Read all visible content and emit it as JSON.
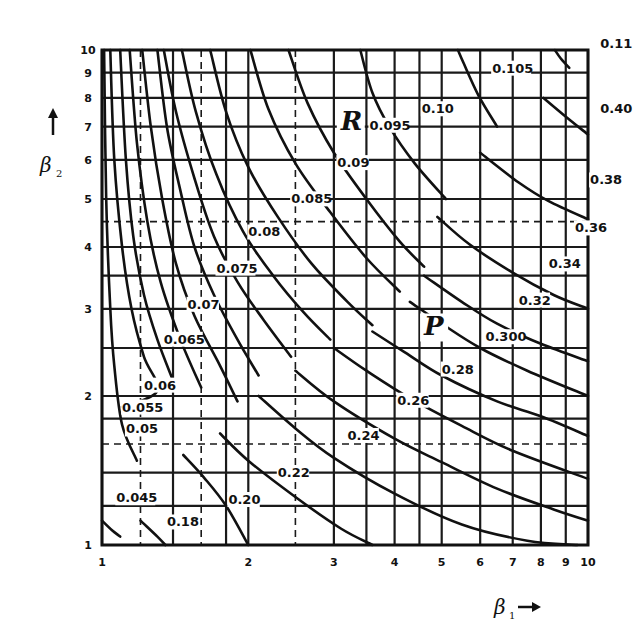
{
  "chart_data": {
    "type": "line",
    "title": "",
    "xlabel": "β1 →",
    "ylabel": "↑ β2",
    "xscale": "log",
    "yscale": "log",
    "xlim": [
      1,
      10
    ],
    "ylim": [
      1,
      10
    ],
    "grid": true,
    "x_ticks": [
      "1",
      "2",
      "3",
      "4",
      "5",
      "6",
      "7",
      "8",
      "9",
      "10"
    ],
    "y_ticks": [
      "1",
      "2",
      "3",
      "4",
      "5",
      "6",
      "7",
      "8",
      "9",
      "10"
    ],
    "x_grid": [
      1,
      1.2,
      1.4,
      1.6,
      1.8,
      2,
      2.5,
      3,
      3.5,
      4,
      4.5,
      5,
      6,
      7,
      8,
      9,
      10
    ],
    "x_grid_dashed": [
      1.2,
      1.6,
      2.5
    ],
    "y_grid": [
      1,
      1.2,
      1.4,
      1.6,
      1.8,
      2,
      2.5,
      3,
      3.5,
      4,
      4.5,
      5,
      6,
      7,
      8,
      9,
      10
    ],
    "y_grid_dashed": [
      1.6,
      4.5
    ],
    "region_labels": [
      {
        "text": "R",
        "x": 3.1,
        "y": 6.9
      },
      {
        "text": "P",
        "x": 4.6,
        "y": 2.65
      }
    ],
    "series": [
      {
        "family": "R",
        "name": "0.045",
        "points": [
          [
            1.01,
            10
          ],
          [
            1.02,
            5
          ],
          [
            1.04,
            3
          ],
          [
            1.06,
            2.3
          ],
          [
            1.1,
            1.75
          ],
          [
            1.18,
            1.48
          ]
        ],
        "p_name": null,
        "p_points": [
          [
            1.0,
            1.12
          ],
          [
            1.05,
            1.07
          ],
          [
            1.09,
            1.04
          ]
        ],
        "label_pos": [
          1.07,
          1.22
        ]
      },
      {
        "family": "R",
        "name": "0.05",
        "points": [
          [
            1.04,
            10
          ],
          [
            1.06,
            6
          ],
          [
            1.1,
            4
          ],
          [
            1.15,
            3
          ],
          [
            1.22,
            2.4
          ],
          [
            1.3,
            2.05
          ],
          [
            1.1,
            1.9
          ]
        ],
        "p_name": null,
        "p_points": [],
        "label_pos": [
          1.12,
          1.68
        ]
      },
      {
        "family": "R",
        "name": "0.055",
        "points": [
          [
            1.09,
            10
          ],
          [
            1.12,
            6
          ],
          [
            1.16,
            4.2
          ],
          [
            1.22,
            3.2
          ],
          [
            1.3,
            2.6
          ],
          [
            1.4,
            2.15
          ]
        ],
        "p_name": "0.18",
        "p_points": [
          [
            1.2,
            1.12
          ],
          [
            1.3,
            1.04
          ],
          [
            1.35,
            1.0
          ]
        ],
        "label_pos": [
          1.1,
          1.86
        ]
      },
      {
        "family": "R",
        "name": "0.06",
        "points": [
          [
            1.14,
            10
          ],
          [
            1.18,
            6.5
          ],
          [
            1.24,
            4.5
          ],
          [
            1.32,
            3.4
          ],
          [
            1.45,
            2.6
          ],
          [
            1.6,
            2.08
          ]
        ],
        "p_name": "0.20",
        "p_points": [
          [
            1.47,
            1.52
          ],
          [
            1.62,
            1.37
          ],
          [
            1.8,
            1.2
          ],
          [
            2.0,
            1.0
          ]
        ],
        "label_pos": [
          1.22,
          2.06
        ]
      },
      {
        "family": "R",
        "name": "0.065",
        "points": [
          [
            1.21,
            10
          ],
          [
            1.26,
            7
          ],
          [
            1.33,
            5
          ],
          [
            1.42,
            3.7
          ],
          [
            1.55,
            2.9
          ],
          [
            1.75,
            2.3
          ],
          [
            1.9,
            1.95
          ]
        ],
        "p_name": "0.22",
        "p_points": [
          [
            1.75,
            1.68
          ],
          [
            2.0,
            1.48
          ],
          [
            2.5,
            1.25
          ],
          [
            3.1,
            1.08
          ],
          [
            3.6,
            1.0
          ]
        ],
        "label_pos": [
          1.34,
          2.55
        ]
      },
      {
        "family": "R",
        "name": "0.07",
        "points": [
          [
            1.3,
            10
          ],
          [
            1.36,
            7
          ],
          [
            1.45,
            5.2
          ],
          [
            1.55,
            4.0
          ],
          [
            1.7,
            3.2
          ],
          [
            1.9,
            2.6
          ],
          [
            2.1,
            2.2
          ]
        ],
        "p_name": "0.24",
        "p_points": [
          [
            2.1,
            2.0
          ],
          [
            2.5,
            1.72
          ],
          [
            3.0,
            1.5
          ],
          [
            4.0,
            1.27
          ],
          [
            5.5,
            1.1
          ],
          [
            7.5,
            1.02
          ],
          [
            9.5,
            1.0
          ]
        ],
        "label_pos": [
          1.5,
          3.0
        ]
      },
      {
        "family": "R",
        "name": "0.075",
        "points": [
          [
            1.34,
            10
          ],
          [
            1.42,
            7.5
          ],
          [
            1.55,
            5.5
          ],
          [
            1.7,
            4.2
          ],
          [
            1.9,
            3.4
          ],
          [
            2.15,
            2.85
          ],
          [
            2.45,
            2.4
          ]
        ],
        "p_name": "0.26",
        "p_points": [
          [
            2.5,
            2.25
          ],
          [
            3.0,
            1.95
          ],
          [
            4.0,
            1.64
          ],
          [
            5.0,
            1.47
          ],
          [
            6.5,
            1.3
          ],
          [
            8.5,
            1.18
          ],
          [
            10,
            1.12
          ]
        ],
        "label_pos": [
          1.72,
          3.55
        ]
      },
      {
        "family": "R",
        "name": "0.08",
        "points": [
          [
            1.46,
            10
          ],
          [
            1.56,
            7.5
          ],
          [
            1.72,
            5.6
          ],
          [
            1.95,
            4.3
          ],
          [
            2.25,
            3.5
          ],
          [
            2.6,
            2.95
          ],
          [
            2.95,
            2.6
          ]
        ],
        "p_name": "0.28",
        "p_points": [
          [
            3.0,
            2.5
          ],
          [
            3.5,
            2.25
          ],
          [
            4.3,
            1.98
          ],
          [
            5.5,
            1.74
          ],
          [
            7.0,
            1.55
          ],
          [
            10,
            1.36
          ]
        ],
        "label_pos": [
          2.0,
          4.2
        ]
      },
      {
        "family": "R",
        "name": "0.085",
        "points": [
          [
            1.67,
            10
          ],
          [
            1.8,
            7.5
          ],
          [
            2.0,
            5.8
          ],
          [
            2.3,
            4.6
          ],
          [
            2.7,
            3.7
          ],
          [
            3.2,
            3.1
          ],
          [
            3.6,
            2.78
          ]
        ],
        "p_name": "0.300",
        "p_points": [
          [
            3.6,
            2.7
          ],
          [
            4.2,
            2.45
          ],
          [
            5.0,
            2.2
          ],
          [
            6.5,
            1.95
          ],
          [
            8.0,
            1.82
          ],
          [
            10,
            1.66
          ]
        ],
        "label_pos": [
          2.45,
          4.9
        ]
      },
      {
        "family": "R",
        "name": "0.09",
        "points": [
          [
            2.02,
            10
          ],
          [
            2.2,
            7.6
          ],
          [
            2.5,
            5.9
          ],
          [
            2.95,
            4.7
          ],
          [
            3.5,
            3.8
          ],
          [
            4.1,
            3.25
          ]
        ],
        "p_name": "0.32",
        "p_points": [
          [
            4.3,
            3.1
          ],
          [
            5.0,
            2.8
          ],
          [
            6.0,
            2.5
          ],
          [
            7.5,
            2.25
          ],
          [
            10,
            2.0
          ]
        ],
        "label_pos": [
          3.05,
          5.8
        ]
      },
      {
        "family": "R",
        "name": "0.095",
        "points": [
          [
            2.42,
            10
          ],
          [
            2.65,
            7.8
          ],
          [
            3.0,
            6.2
          ],
          [
            3.5,
            5.0
          ],
          [
            4.1,
            4.1
          ],
          [
            4.6,
            3.65
          ]
        ],
        "p_name": "0.34",
        "p_points": [
          [
            4.6,
            3.5
          ],
          [
            5.5,
            3.1
          ],
          [
            6.5,
            2.8
          ],
          [
            8.0,
            2.55
          ],
          [
            10,
            2.35
          ]
        ],
        "label_pos": [
          3.55,
          6.9
        ]
      },
      {
        "family": "R",
        "name": "0.10",
        "points": [
          [
            3.4,
            10
          ],
          [
            3.6,
            8.2
          ],
          [
            3.9,
            7.0
          ],
          [
            4.4,
            5.9
          ],
          [
            5.1,
            5.0
          ]
        ],
        "p_name": "0.36",
        "p_points": [
          [
            4.9,
            4.6
          ],
          [
            5.7,
            4.05
          ],
          [
            7.0,
            3.55
          ],
          [
            8.5,
            3.2
          ],
          [
            10,
            3.0
          ]
        ],
        "label_pos": [
          4.55,
          7.45
        ]
      },
      {
        "family": "R",
        "name": "0.105",
        "points": [
          [
            5.4,
            10
          ],
          [
            5.55,
            9.4
          ],
          [
            5.95,
            8.1
          ],
          [
            6.5,
            7.0
          ]
        ],
        "p_name": "0.38",
        "p_points": [
          [
            6.0,
            6.2
          ],
          [
            7.2,
            5.4
          ],
          [
            8.3,
            4.95
          ],
          [
            10,
            4.55
          ]
        ],
        "label_pos": [
          6.35,
          9.0
        ]
      },
      {
        "family": "R",
        "name": "0.11",
        "points": [
          [
            8.55,
            10
          ],
          [
            8.8,
            9.6
          ],
          [
            9.15,
            9.2
          ]
        ],
        "p_name": "0.40",
        "p_points": [
          [
            8.1,
            8.0
          ],
          [
            8.9,
            7.4
          ],
          [
            10,
            6.75
          ]
        ],
        "label_pos": [
          10.6,
          10.1
        ]
      }
    ],
    "p_label_pos": {
      "0.18": [
        1.36,
        1.09
      ],
      "0.20": [
        1.82,
        1.21
      ],
      "0.22": [
        2.3,
        1.37
      ],
      "0.24": [
        3.2,
        1.63
      ],
      "0.26": [
        4.05,
        1.92
      ],
      "0.28": [
        5.0,
        2.22
      ],
      "0.300": [
        6.15,
        2.58
      ],
      "0.32": [
        7.2,
        3.06
      ],
      "0.34": [
        8.3,
        3.62
      ],
      "0.36": [
        9.4,
        4.28
      ],
      "0.38": [
        10.1,
        5.35
      ],
      "0.40": [
        10.6,
        7.45
      ]
    }
  }
}
